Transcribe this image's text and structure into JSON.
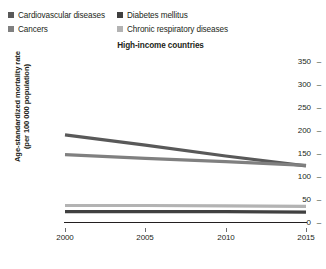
{
  "chart_data": {
    "type": "line",
    "title": "High-income countries",
    "xlabel": "",
    "ylabel": "Age-standardized mortality rate (per 100 000 population)",
    "ylabel_line1": "Age-standardized mortality rate",
    "ylabel_line2": "(per 100 000 population)",
    "x": [
      2000,
      2005,
      2010,
      2015
    ],
    "xtick_labels": [
      "2000",
      "2005",
      "2010",
      "2015"
    ],
    "ytick_labels": [
      "350",
      "300",
      "250",
      "200",
      "150",
      "100",
      "50",
      "0"
    ],
    "ytick_values": [
      350,
      300,
      250,
      200,
      150,
      100,
      50,
      0
    ],
    "ylim": [
      0,
      350
    ],
    "xlim": [
      2000,
      2015
    ],
    "grid": false,
    "legend_position": "top-left",
    "series": [
      {
        "name": "Cardiovascular diseases",
        "color": "#595959",
        "values": [
          185,
          163,
          140,
          119
        ]
      },
      {
        "name": "Diabetes mellitus",
        "color": "#404040",
        "values": [
          22,
          22,
          22,
          21
        ]
      },
      {
        "name": "Cancers",
        "color": "#808080",
        "values": [
          143,
          135,
          128,
          120
        ]
      },
      {
        "name": "Chronic respiratory diseases",
        "color": "#b3b3b3",
        "values": [
          35,
          35,
          34,
          33
        ]
      }
    ]
  },
  "legend": {
    "items": [
      {
        "label": "Cardiovascular diseases",
        "color": "#595959",
        "column": 0
      },
      {
        "label": "Diabetes mellitus",
        "color": "#404040",
        "column": 1
      },
      {
        "label": "Cancers",
        "color": "#808080",
        "column": 0
      },
      {
        "label": "Chronic respiratory diseases",
        "color": "#b3b3b3",
        "column": 1
      }
    ]
  },
  "axis": {
    "tick_dash": "–"
  }
}
